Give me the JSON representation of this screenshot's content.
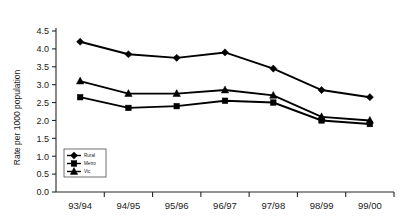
{
  "chart_data": {
    "type": "line",
    "title": "",
    "xlabel": "",
    "ylabel": "Rate per 1000 population",
    "categories": [
      "93/94",
      "94/95",
      "95/96",
      "96/97",
      "97/98",
      "98/99",
      "99/00"
    ],
    "ylim": [
      0.0,
      4.5
    ],
    "ytick_labels": [
      "0.0",
      "0.5",
      "1.0",
      "1.5",
      "2.0",
      "2.5",
      "3.0",
      "3.5",
      "4.0",
      "4.5"
    ],
    "ytick_values": [
      0.0,
      0.5,
      1.0,
      1.5,
      2.0,
      2.5,
      3.0,
      3.5,
      4.0,
      4.5
    ],
    "grid": false,
    "legend_position": "lower-left-inside",
    "series": [
      {
        "name": "Rural",
        "marker": "diamond",
        "color": "#000000",
        "values": [
          4.2,
          3.85,
          3.75,
          3.9,
          3.45,
          2.85,
          2.65
        ]
      },
      {
        "name": "Metro",
        "marker": "square",
        "color": "#000000",
        "values": [
          2.65,
          2.35,
          2.4,
          2.55,
          2.5,
          2.0,
          1.9
        ]
      },
      {
        "name": "Vic",
        "marker": "triangle",
        "color": "#000000",
        "values": [
          3.1,
          2.75,
          2.75,
          2.85,
          2.7,
          2.1,
          2.0
        ]
      }
    ]
  }
}
